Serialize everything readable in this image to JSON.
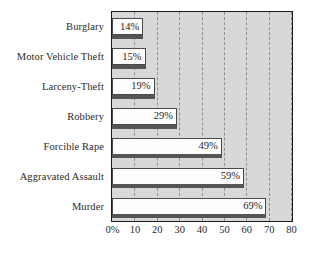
{
  "chart_data": {
    "type": "bar",
    "orientation": "horizontal",
    "title": "",
    "xlabel": "",
    "ylabel": "",
    "xlim": [
      0,
      80
    ],
    "grid": true,
    "legend": false,
    "categories": [
      "Burglary",
      "Motor Vehicle Theft",
      "Larceny-Theft",
      "Robbery",
      "Forcible Rape",
      "Aggravated Assault",
      "Murder"
    ],
    "values": [
      14,
      15,
      19,
      29,
      49,
      59,
      69
    ],
    "value_labels": [
      "14%",
      "15%",
      "19%",
      "29%",
      "49%",
      "59%",
      "69%"
    ],
    "xticks": [
      0,
      10,
      20,
      30,
      40,
      50,
      60,
      70,
      80
    ],
    "xtick_labels": [
      "0%",
      "10",
      "20",
      "30",
      "40",
      "50",
      "60",
      "70",
      "80"
    ],
    "colors": {
      "plot_background": "#d8d8d8",
      "page_background": "#ffffff",
      "bar_fill": "#fdfdfd",
      "bar_border": "#4a4a4a",
      "bar_shadow": "#555555",
      "gridline": "#8f8f8f",
      "axis_border": "#1a1a1a",
      "text": "#2b2b2b"
    }
  }
}
